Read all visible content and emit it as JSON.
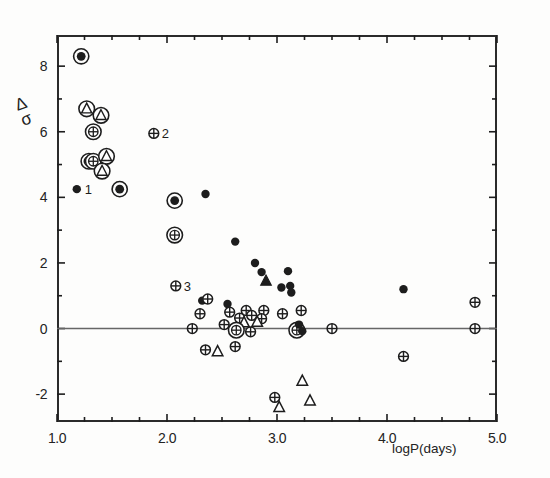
{
  "figure": {
    "background": "#fdfdfc",
    "ink": "#1d1d1d"
  },
  "axes": {
    "x_title": "logP(days)",
    "y_title_numerator": "Δ",
    "y_title_denominator": "σ",
    "x_ticklabels": [
      "1.0",
      "2.0",
      "3.0",
      "4.0",
      "5.0"
    ],
    "x_tickvalues": [
      1.0,
      2.0,
      3.0,
      4.0,
      5.0
    ],
    "y_ticklabels": [
      "-2",
      "0",
      "2",
      "4",
      "6",
      "8"
    ],
    "y_tickvalues": [
      -2,
      0,
      2,
      4,
      6,
      8
    ]
  },
  "chart_data": {
    "type": "scatter",
    "title": "",
    "xlabel": "logP(days)",
    "ylabel": "Δ/σ",
    "xlim": [
      1.0,
      5.0
    ],
    "ylim": [
      -2.85,
      8.95
    ],
    "grid": false,
    "legend": "none",
    "zero_reference_line": 0,
    "xticks": [
      1.0,
      1.25,
      1.5,
      1.75,
      2.0,
      2.25,
      2.5,
      2.75,
      3.0,
      3.25,
      3.5,
      3.75,
      4.0,
      4.25,
      4.5,
      4.75,
      5.0
    ],
    "xticklabels_at": [
      1.0,
      2.0,
      3.0,
      4.0,
      5.0
    ],
    "yticks": [
      -2,
      -1,
      0,
      1,
      2,
      3,
      4,
      5,
      6,
      7,
      8
    ],
    "yticklabels_at": [
      -2,
      0,
      2,
      4,
      6,
      8
    ],
    "marker_types": {
      "filled-dot": "small solid black circle",
      "circled-dot": "solid black circle inside open ring",
      "crossed-circle": "open circle with vertical+horizontal cross",
      "circled-crossed-circle": "crossed circle inside open ring",
      "open-triangle": "open upward triangle",
      "filled-triangle": "solid black upward triangle",
      "circled-triangle": "open triangle inside open ring"
    },
    "annotations": [
      {
        "text": "1",
        "x": 1.18,
        "y": 4.25
      },
      {
        "text": "2",
        "x": 1.88,
        "y": 5.95
      },
      {
        "text": "3",
        "x": 2.08,
        "y": 1.3
      }
    ],
    "points": [
      {
        "x": 1.22,
        "y": 8.3,
        "marker": "circled-dot"
      },
      {
        "x": 1.27,
        "y": 6.7,
        "marker": "circled-triangle"
      },
      {
        "x": 1.4,
        "y": 6.5,
        "marker": "circled-triangle"
      },
      {
        "x": 1.33,
        "y": 6.0,
        "marker": "circled-crossed-circle"
      },
      {
        "x": 1.29,
        "y": 5.1,
        "marker": "circled-crossed-circle"
      },
      {
        "x": 1.33,
        "y": 5.1,
        "marker": "circled-crossed-circle"
      },
      {
        "x": 1.45,
        "y": 5.25,
        "marker": "circled-triangle"
      },
      {
        "x": 1.41,
        "y": 4.8,
        "marker": "circled-triangle"
      },
      {
        "x": 1.18,
        "y": 4.25,
        "marker": "filled-dot"
      },
      {
        "x": 1.57,
        "y": 4.25,
        "marker": "circled-dot"
      },
      {
        "x": 1.88,
        "y": 5.95,
        "marker": "crossed-circle"
      },
      {
        "x": 2.07,
        "y": 3.9,
        "marker": "circled-dot"
      },
      {
        "x": 2.35,
        "y": 4.1,
        "marker": "filled-dot"
      },
      {
        "x": 2.07,
        "y": 2.85,
        "marker": "circled-crossed-circle"
      },
      {
        "x": 2.08,
        "y": 1.3,
        "marker": "crossed-circle"
      },
      {
        "x": 2.62,
        "y": 2.65,
        "marker": "filled-dot"
      },
      {
        "x": 2.8,
        "y": 2.0,
        "marker": "filled-dot"
      },
      {
        "x": 2.86,
        "y": 1.72,
        "marker": "filled-dot"
      },
      {
        "x": 2.9,
        "y": 1.45,
        "marker": "filled-triangle"
      },
      {
        "x": 3.1,
        "y": 1.75,
        "marker": "filled-dot"
      },
      {
        "x": 3.04,
        "y": 1.25,
        "marker": "filled-dot"
      },
      {
        "x": 3.12,
        "y": 1.3,
        "marker": "filled-dot"
      },
      {
        "x": 3.13,
        "y": 1.1,
        "marker": "filled-dot"
      },
      {
        "x": 4.15,
        "y": 1.2,
        "marker": "filled-dot"
      },
      {
        "x": 2.32,
        "y": 0.85,
        "marker": "filled-dot"
      },
      {
        "x": 2.37,
        "y": 0.9,
        "marker": "crossed-circle"
      },
      {
        "x": 2.55,
        "y": 0.75,
        "marker": "filled-dot"
      },
      {
        "x": 2.3,
        "y": 0.45,
        "marker": "crossed-circle"
      },
      {
        "x": 2.57,
        "y": 0.5,
        "marker": "crossed-circle"
      },
      {
        "x": 2.72,
        "y": 0.55,
        "marker": "crossed-circle"
      },
      {
        "x": 2.66,
        "y": 0.32,
        "marker": "crossed-circle"
      },
      {
        "x": 2.77,
        "y": 0.4,
        "marker": "crossed-circle"
      },
      {
        "x": 2.88,
        "y": 0.55,
        "marker": "crossed-circle"
      },
      {
        "x": 2.86,
        "y": 0.3,
        "marker": "crossed-circle"
      },
      {
        "x": 3.05,
        "y": 0.45,
        "marker": "crossed-circle"
      },
      {
        "x": 3.22,
        "y": 0.55,
        "marker": "crossed-circle"
      },
      {
        "x": 2.23,
        "y": 0.0,
        "marker": "crossed-circle"
      },
      {
        "x": 2.52,
        "y": 0.12,
        "marker": "crossed-circle"
      },
      {
        "x": 2.7,
        "y": 0.18,
        "marker": "open-triangle"
      },
      {
        "x": 2.82,
        "y": 0.2,
        "marker": "open-triangle"
      },
      {
        "x": 2.63,
        "y": -0.05,
        "marker": "circled-crossed-circle"
      },
      {
        "x": 2.76,
        "y": -0.1,
        "marker": "crossed-circle"
      },
      {
        "x": 3.18,
        "y": -0.05,
        "marker": "circled-crossed-circle"
      },
      {
        "x": 3.2,
        "y": 0.12,
        "marker": "filled-dot"
      },
      {
        "x": 3.23,
        "y": -0.08,
        "marker": "filled-dot"
      },
      {
        "x": 3.5,
        "y": 0.0,
        "marker": "crossed-circle"
      },
      {
        "x": 4.8,
        "y": 0.0,
        "marker": "crossed-circle"
      },
      {
        "x": 4.8,
        "y": 0.8,
        "marker": "crossed-circle"
      },
      {
        "x": 4.15,
        "y": -0.85,
        "marker": "crossed-circle"
      },
      {
        "x": 2.35,
        "y": -0.65,
        "marker": "crossed-circle"
      },
      {
        "x": 2.46,
        "y": -0.7,
        "marker": "open-triangle"
      },
      {
        "x": 2.62,
        "y": -0.55,
        "marker": "crossed-circle"
      },
      {
        "x": 3.23,
        "y": -1.6,
        "marker": "open-triangle"
      },
      {
        "x": 2.98,
        "y": -2.1,
        "marker": "crossed-circle"
      },
      {
        "x": 3.02,
        "y": -2.4,
        "marker": "open-triangle"
      },
      {
        "x": 3.3,
        "y": -2.2,
        "marker": "open-triangle"
      }
    ]
  }
}
